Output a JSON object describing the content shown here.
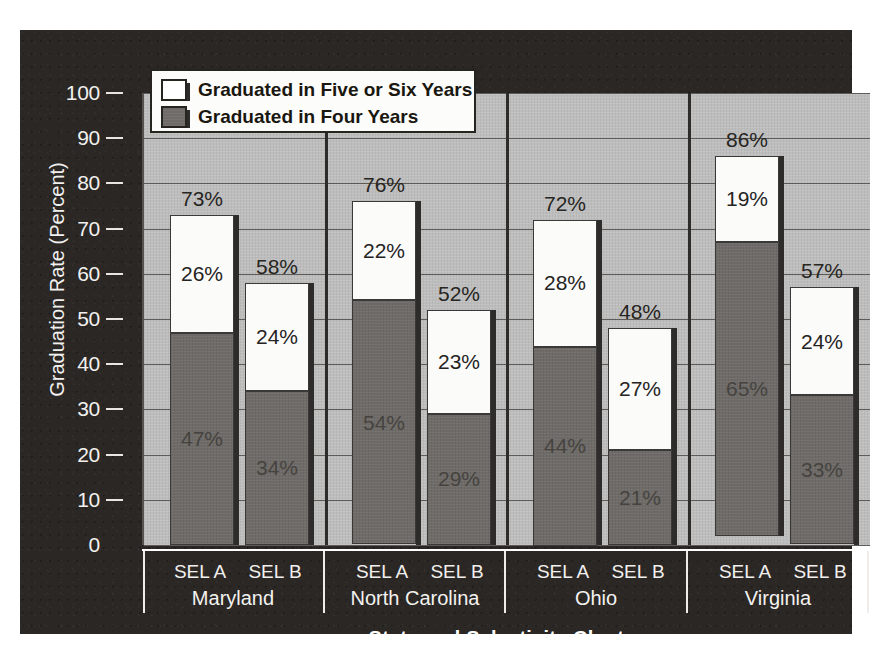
{
  "chart_data": {
    "type": "bar",
    "subtype": "stacked",
    "title": "",
    "xlabel": "State and Selectivity Cluster",
    "ylabel": "Graduation Rate (Percent)",
    "ylim": [
      0,
      100
    ],
    "ytick_labels": [
      "100",
      "90",
      "80",
      "70",
      "60",
      "50",
      "40",
      "30",
      "20",
      "10",
      "0"
    ],
    "yticks": [
      100,
      90,
      80,
      70,
      60,
      50,
      40,
      30,
      20,
      10,
      0
    ],
    "grid": true,
    "legend_position": "upper-left-inside",
    "series": [
      {
        "name": "Graduated in Five or Six Years",
        "color": "#ffffff",
        "values": [
          26,
          24,
          22,
          23,
          28,
          27,
          19,
          24
        ]
      },
      {
        "name": "Graduated in Four Years",
        "color": "#6e6b68",
        "values": [
          47,
          34,
          54,
          29,
          44,
          21,
          65,
          33
        ]
      }
    ],
    "totals": [
      73,
      58,
      76,
      52,
      72,
      48,
      86,
      57
    ],
    "categories": [
      "SEL A",
      "SEL B",
      "SEL A",
      "SEL B",
      "SEL A",
      "SEL B",
      "SEL A",
      "SEL B"
    ],
    "groups": [
      "Maryland",
      "North Carolina",
      "Ohio",
      "Virginia"
    ],
    "bars": [
      {
        "group": "Maryland",
        "cluster": "SEL A",
        "four_year": 47,
        "five_or_six_year": 26,
        "total": 73,
        "four_year_label": "47%",
        "five_or_six_year_label": "26%",
        "total_label": "73%"
      },
      {
        "group": "Maryland",
        "cluster": "SEL B",
        "four_year": 34,
        "five_or_six_year": 24,
        "total": 58,
        "four_year_label": "34%",
        "five_or_six_year_label": "24%",
        "total_label": "58%"
      },
      {
        "group": "North Carolina",
        "cluster": "SEL A",
        "four_year": 54,
        "five_or_six_year": 22,
        "total": 76,
        "four_year_label": "54%",
        "five_or_six_year_label": "22%",
        "total_label": "76%"
      },
      {
        "group": "North Carolina",
        "cluster": "SEL B",
        "four_year": 29,
        "five_or_six_year": 23,
        "total": 52,
        "four_year_label": "29%",
        "five_or_six_year_label": "23%",
        "total_label": "52%"
      },
      {
        "group": "Ohio",
        "cluster": "SEL A",
        "four_year": 44,
        "five_or_six_year": 28,
        "total": 72,
        "four_year_label": "44%",
        "five_or_six_year_label": "28%",
        "total_label": "72%"
      },
      {
        "group": "Ohio",
        "cluster": "SEL B",
        "four_year": 21,
        "five_or_six_year": 27,
        "total": 48,
        "four_year_label": "21%",
        "five_or_six_year_label": "27%",
        "total_label": "48%"
      },
      {
        "group": "Virginia",
        "cluster": "SEL A",
        "four_year": 65,
        "five_or_six_year": 19,
        "total": 86,
        "four_year_label": "65%",
        "five_or_six_year_label": "19%",
        "total_label": "86%"
      },
      {
        "group": "Virginia",
        "cluster": "SEL B",
        "four_year": 33,
        "five_or_six_year": 24,
        "total": 57,
        "four_year_label": "33%",
        "five_or_six_year_label": "24%",
        "total_label": "57%"
      }
    ]
  },
  "axes": {
    "y_title": "Graduation Rate (Percent)",
    "x_title": "State and Selectivity Cluster",
    "y_ticks": [
      "100",
      "90",
      "80",
      "70",
      "60",
      "50",
      "40",
      "30",
      "20",
      "10",
      "0"
    ]
  },
  "legend": {
    "items": [
      {
        "label": "Graduated in Five or Six Years",
        "swatch": "white"
      },
      {
        "label": "Graduated in Four Years",
        "swatch": "gray"
      }
    ]
  },
  "x_axis": {
    "cluster_labels": [
      "SEL A",
      "SEL B",
      "SEL A",
      "SEL B",
      "SEL A",
      "SEL B",
      "SEL A",
      "SEL B"
    ],
    "state_labels": [
      "Maryland",
      "North Carolina",
      "Ohio",
      "Virginia"
    ]
  },
  "colors": {
    "panel_background": "#2a2725",
    "plot_background": "#bdbdbd",
    "four_year_fill": "#6e6b68",
    "five_or_six_year_fill": "#ffffff",
    "gridline": "#5d5a57",
    "axis_text_light": "#f2f0ee",
    "label_text_dark": "#27251f"
  }
}
